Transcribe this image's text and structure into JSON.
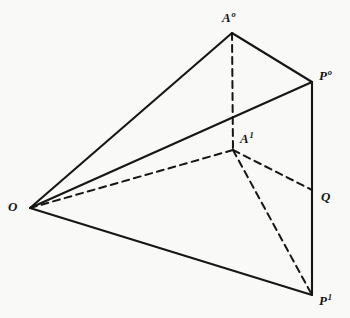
{
  "figure": {
    "background_color": "#f9f9f7",
    "stroke_color": "#161616",
    "canvas": {
      "width": 350,
      "height": 318
    },
    "solid_stroke_width": 2.1,
    "dashed_stroke_width": 2.0,
    "dash_pattern": "7,5"
  },
  "vertices": [
    {
      "id": "O",
      "base": "O",
      "sup": "",
      "x": 30,
      "y": 208,
      "label_x": 8,
      "label_y": 200,
      "name": "vertex-label-o"
    },
    {
      "id": "A0",
      "base": "A",
      "sup": "o",
      "x": 232,
      "y": 33,
      "label_x": 222,
      "label_y": 10,
      "name": "vertex-label-a0"
    },
    {
      "id": "P0",
      "base": "P",
      "sup": "o",
      "x": 312,
      "y": 82,
      "label_x": 319,
      "label_y": 68,
      "name": "vertex-label-p0"
    },
    {
      "id": "A1",
      "base": "A",
      "sup": "1",
      "x": 233,
      "y": 150,
      "label_x": 240,
      "label_y": 131,
      "name": "vertex-label-a1"
    },
    {
      "id": "Q",
      "base": "Q",
      "sup": "",
      "x": 312,
      "y": 190,
      "label_x": 321,
      "label_y": 190,
      "name": "vertex-label-q"
    },
    {
      "id": "P1",
      "base": "P",
      "sup": "1",
      "x": 312,
      "y": 295,
      "label_x": 319,
      "label_y": 293,
      "name": "vertex-label-p1"
    }
  ],
  "edges": [
    {
      "id": "O-A0",
      "from": "O",
      "to": "A0",
      "style": "solid",
      "name": "edge-o-a0"
    },
    {
      "id": "A0-P0",
      "from": "A0",
      "to": "P0",
      "style": "solid",
      "name": "edge-a0-p0"
    },
    {
      "id": "O-P0",
      "from": "O",
      "to": "P0",
      "style": "solid",
      "name": "edge-o-p0"
    },
    {
      "id": "O-P1",
      "from": "O",
      "to": "P1",
      "style": "solid",
      "name": "edge-o-p1"
    },
    {
      "id": "P0-P1",
      "from": "P0",
      "to": "P1",
      "style": "solid",
      "name": "edge-p0-p1"
    },
    {
      "id": "A0-A1",
      "from": "A0",
      "to": "A1",
      "style": "dashed",
      "name": "edge-a0-a1"
    },
    {
      "id": "O-A1",
      "from": "O",
      "to": "A1",
      "style": "dashed",
      "name": "edge-o-a1"
    },
    {
      "id": "A1-Q",
      "from": "A1",
      "to": "Q",
      "style": "dashed",
      "name": "edge-a1-q"
    },
    {
      "id": "A1-P1",
      "from": "A1",
      "to": "P1",
      "style": "dashed",
      "name": "edge-a1-p1"
    }
  ]
}
